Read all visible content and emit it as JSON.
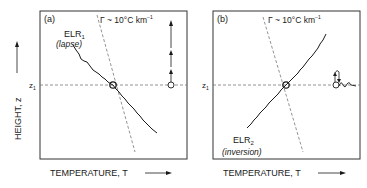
{
  "figure": {
    "y_axis_label": "HEIGHT, z",
    "z_marker": "z",
    "z_marker_sub": "1",
    "lapse_rate_label": "Γ ~ 10°C km",
    "lapse_rate_exp": "−1",
    "colors": {
      "ink": "#1a1a1a",
      "dashed": "#777777",
      "background": "#ffffff"
    }
  },
  "panels": [
    {
      "id": "a",
      "tag": "(a)",
      "curve_label": "ELR",
      "curve_sub": "1",
      "curve_desc": "(lapse)",
      "x_axis_label": "TEMPERATURE,  T",
      "parcel_behaviour": "rising (unstable) — arrows pointing upward"
    },
    {
      "id": "b",
      "tag": "(b)",
      "curve_label": "ELR",
      "curve_sub": "2",
      "curve_desc": "(inversion)",
      "x_axis_label": "TEMPERATURE,  T",
      "parcel_behaviour": "oscillating (stable) — up/down arrows with damped wave"
    }
  ]
}
